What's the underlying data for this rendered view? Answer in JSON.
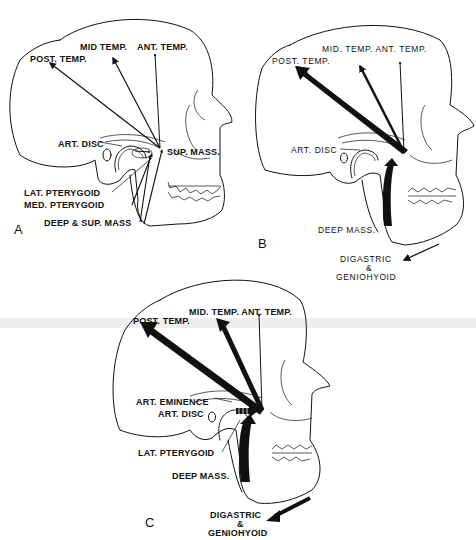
{
  "figure": {
    "colors": {
      "ink": "#111111",
      "background": "#ffffff"
    }
  },
  "panels": [
    {
      "letter": "A",
      "labels": {
        "post_temp": "POST. TEMP.",
        "mid_temp": "MID TEMP.",
        "ant_temp": "ANT. TEMP.",
        "art_disc": "ART. DISC",
        "sup_mass": "SUP. MASS.",
        "lat_pterygoid": "LAT. PTERYGOID",
        "med_pterygoid": "MED. PTERYGOID",
        "deep_sup_mass": "DEEP & SUP. MASS"
      }
    },
    {
      "letter": "B",
      "labels": {
        "mid_ant_temp": "MID. TEMP.  ANT. TEMP.",
        "post_temp": "POST. TEMP.",
        "art_disc": "ART. DISC",
        "deep_mass": "DEEP MASS.",
        "digastric": "DIGASTRIC",
        "ampersand": "&",
        "geniohyoid": "GENIOHYOID"
      }
    },
    {
      "letter": "C",
      "labels": {
        "mid_ant_temp": "MID. TEMP. ANT. TEMP.",
        "post_temp": "POST. TEMP.",
        "art_eminence": "ART. EMINENCE",
        "art_disc": "ART. DISC",
        "lat_pterygoid": "LAT. PTERYGOID",
        "deep_mass": "DEEP MASS.",
        "digastric": "DIGASTRIC",
        "ampersand": "&",
        "geniohyoid": "GENIOHYOID"
      }
    }
  ]
}
